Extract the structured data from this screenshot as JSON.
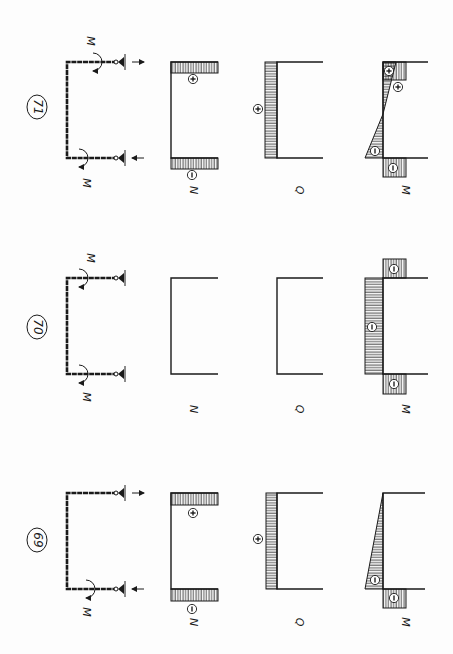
{
  "page": {
    "orientation": "rotated-90-ccw",
    "colors": {
      "ink": "#1a1a1a",
      "paper": "#fdfdfd"
    }
  },
  "panels": [
    {
      "number": "71",
      "number_pos": [
        37,
        107
      ],
      "top_y": 62,
      "bottom_y": 158,
      "frame": {
        "x_left": 67,
        "x_right": 117
      },
      "moments": [
        {
          "label": "M",
          "at": [
            95,
            62
          ],
          "label_pos": [
            90,
            41
          ]
        },
        {
          "label": "M",
          "at": [
            81,
            158
          ],
          "label_pos": [
            86,
            183
          ]
        }
      ],
      "supports": [
        {
          "y": 62,
          "arrow": "right"
        },
        {
          "y": 158,
          "arrow": "left"
        }
      ],
      "N": {
        "label": "N",
        "axis_x": 171,
        "end_x": 218,
        "bands": [
          {
            "y0": 62,
            "y1": 73,
            "sign": "+",
            "sign_pos": [
              193,
              79
            ]
          },
          {
            "y0": 158,
            "y1": 169,
            "sign": "−",
            "sign_pos": [
              192,
              175
            ]
          }
        ]
      },
      "Q": {
        "label": "Q",
        "axis_x": 277,
        "end_x": 323,
        "band": {
          "x0": 265,
          "sign": "+",
          "sign_pos": [
            258,
            109
          ]
        }
      },
      "M": {
        "label": "M",
        "axis_x": 383,
        "end_x": 428,
        "signs": [
          {
            "s": "+",
            "pos": [
              389,
              71
            ]
          },
          {
            "s": "+",
            "pos": [
              398,
              87
            ]
          },
          {
            "s": "−",
            "pos": [
              375,
              151
            ]
          },
          {
            "s": "−",
            "pos": [
              393,
              168
            ]
          }
        ]
      },
      "labels_y": 190
    },
    {
      "number": "70",
      "number_pos": [
        37,
        327
      ],
      "top_y": 278,
      "bottom_y": 374,
      "frame": {
        "x_left": 67,
        "x_right": 117
      },
      "moments": [
        {
          "label": "M",
          "at": [
            81,
            278
          ],
          "label_pos": [
            90,
            258
          ]
        },
        {
          "label": "M",
          "at": [
            81,
            374
          ],
          "label_pos": [
            86,
            397
          ]
        }
      ],
      "supports": [
        {
          "y": 278,
          "arrow": "none"
        },
        {
          "y": 374,
          "arrow": "none"
        }
      ],
      "N": {
        "label": "N",
        "axis_x": 171,
        "end_x": 218,
        "bands": []
      },
      "Q": {
        "label": "Q",
        "axis_x": 277,
        "end_x": 323,
        "band": null
      },
      "M": {
        "label": "M",
        "axis_x": 383,
        "end_x": 428,
        "signs": [
          {
            "s": "−",
            "pos": [
              394,
              269
            ]
          },
          {
            "s": "−",
            "pos": [
              372,
              327
            ]
          },
          {
            "s": "−",
            "pos": [
              394,
              384
            ]
          }
        ]
      },
      "labels_y": 409
    },
    {
      "number": "69",
      "number_pos": [
        37,
        540
      ],
      "top_y": 493,
      "bottom_y": 589,
      "frame": {
        "x_left": 67,
        "x_right": 117
      },
      "moments": [
        {
          "label": "M",
          "at": [
            88,
            589
          ],
          "label_pos": [
            86,
            612
          ]
        }
      ],
      "supports": [
        {
          "y": 493,
          "arrow": "right"
        },
        {
          "y": 589,
          "arrow": "left"
        }
      ],
      "N": {
        "label": "N",
        "axis_x": 171,
        "end_x": 218,
        "bands": [
          {
            "y0": 493,
            "y1": 505,
            "sign": "+",
            "sign_pos": [
              193,
              513
            ]
          },
          {
            "y0": 589,
            "y1": 601,
            "sign": "−",
            "sign_pos": [
              192,
              609
            ]
          }
        ]
      },
      "Q": {
        "label": "Q",
        "axis_x": 277,
        "end_x": 323,
        "band": {
          "x0": 266,
          "sign": "+",
          "sign_pos": [
            258,
            539
          ]
        }
      },
      "M": {
        "label": "M",
        "axis_x": 383,
        "end_x": 425,
        "signs": [
          {
            "s": "−",
            "pos": [
              375,
              580
            ]
          },
          {
            "s": "−",
            "pos": [
              394,
              598
            ]
          }
        ]
      },
      "labels_y": 622
    }
  ],
  "text": {
    "p71": "71",
    "p70": "70",
    "p69": "69",
    "N": "N",
    "Q": "Q",
    "M": "M",
    "plus": "+",
    "minus": "−"
  }
}
